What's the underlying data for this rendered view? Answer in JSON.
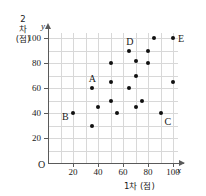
{
  "chart_data": {
    "type": "scatter",
    "title": "",
    "xlabel": "1차 (점)",
    "ylabel": "2차 (점)",
    "x_axis_var": "x",
    "y_axis_var": "y",
    "origin_label": "O",
    "xlim": [
      0,
      104
    ],
    "ylim": [
      0,
      104
    ],
    "xticks": [
      20,
      40,
      60,
      80,
      100
    ],
    "yticks": [
      20,
      40,
      60,
      80,
      100
    ],
    "xtick_labels": [
      "20",
      "40",
      "60",
      "80",
      "100"
    ],
    "ytick_labels": [
      "20",
      "40",
      "60",
      "80",
      "100"
    ],
    "grid": true,
    "legend": "none",
    "points": [
      {
        "x": 20,
        "y": 40,
        "label": "B",
        "label_pos": "left"
      },
      {
        "x": 35,
        "y": 30,
        "label": "",
        "label_pos": ""
      },
      {
        "x": 40,
        "y": 45,
        "label": "",
        "label_pos": ""
      },
      {
        "x": 35,
        "y": 60,
        "label": "A",
        "label_pos": "above"
      },
      {
        "x": 50,
        "y": 80,
        "label": "",
        "label_pos": ""
      },
      {
        "x": 50,
        "y": 65,
        "label": "",
        "label_pos": ""
      },
      {
        "x": 50,
        "y": 50,
        "label": "",
        "label_pos": ""
      },
      {
        "x": 55,
        "y": 40,
        "label": "",
        "label_pos": ""
      },
      {
        "x": 65,
        "y": 90,
        "label": "D",
        "label_pos": "above"
      },
      {
        "x": 65,
        "y": 60,
        "label": "",
        "label_pos": ""
      },
      {
        "x": 70,
        "y": 82,
        "label": "",
        "label_pos": ""
      },
      {
        "x": 70,
        "y": 70,
        "label": "",
        "label_pos": ""
      },
      {
        "x": 70,
        "y": 45,
        "label": "",
        "label_pos": ""
      },
      {
        "x": 75,
        "y": 50,
        "label": "",
        "label_pos": ""
      },
      {
        "x": 80,
        "y": 90,
        "label": "",
        "label_pos": ""
      },
      {
        "x": 80,
        "y": 80,
        "label": "",
        "label_pos": ""
      },
      {
        "x": 85,
        "y": 100,
        "label": "",
        "label_pos": ""
      },
      {
        "x": 90,
        "y": 40,
        "label": "C",
        "label_pos": "below-right"
      },
      {
        "x": 100,
        "y": 100,
        "label": "E",
        "label_pos": "right"
      },
      {
        "x": 100,
        "y": 65,
        "label": "",
        "label_pos": ""
      }
    ],
    "ylabel_lines": [
      "2",
      "차",
      "(점)"
    ],
    "colors": {
      "point": "#111111",
      "axis": "#5a5a5a",
      "grid": "#d8d8d8",
      "text": "#1a1a1a",
      "background": "#ffffff"
    }
  }
}
